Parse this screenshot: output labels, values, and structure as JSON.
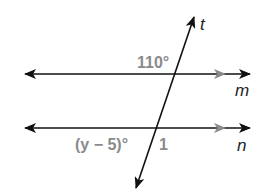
{
  "diagram": {
    "type": "parallel-lines-transversal",
    "lines": [
      {
        "name": "m",
        "label": "m",
        "role": "parallel line"
      },
      {
        "name": "n",
        "label": "n",
        "role": "parallel line"
      },
      {
        "name": "t",
        "label": "t",
        "role": "transversal"
      }
    ],
    "angles": [
      {
        "id": "angle-110",
        "label": "110°",
        "position": "line m, upper-left of intersection with t"
      },
      {
        "id": "angle-y-minus-5",
        "label": "(y − 5)°",
        "position": "line n, lower-left of intersection with t"
      },
      {
        "id": "angle-1",
        "label": "1",
        "position": "line n, lower-right of intersection with t"
      }
    ],
    "colors": {
      "line": "#111111",
      "parallel_marker": "#8a8a8a",
      "angle_label": "#8a8a8a",
      "line_label": "#222222"
    }
  }
}
